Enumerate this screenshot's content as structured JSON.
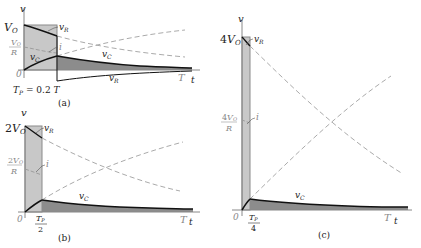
{
  "colors": {
    "axis": "#888888",
    "pulse_fill": "#c8c8c8",
    "pulse_stroke": "#8a8a8a",
    "vc_fill": "#8c8c8c",
    "curve": "#111111",
    "dashed": "#a0a0a0",
    "gray_text": "#888888"
  },
  "panels": [
    {
      "id": "a",
      "caption": "(a)",
      "y_axis_label": "v",
      "x_axis_label": "t",
      "origin_label": "0",
      "T_label": "T",
      "v_peak_label": "V",
      "v_peak_sub": "O",
      "v_peak_prefix": "",
      "current_label_num": "V",
      "current_label_num_sub": "O",
      "current_label_den": "R",
      "current_label_prefix": "",
      "pulse_width_label": "T_P = 0.2 T",
      "pulse_width_text_a": "T",
      "pulse_width_text_sub": "P",
      "pulse_width_text_b": " = 0.2 ",
      "pulse_width_text_c": "T",
      "curve_labels": {
        "vR_top": "v",
        "vR_top_sub": "R",
        "i": "i",
        "vC_left": "v",
        "vC_left_sub": "C",
        "vC_right": "v",
        "vC_right_sub": "C",
        "vR_bottom": "v",
        "vR_bottom_sub": "R"
      }
    },
    {
      "id": "b",
      "caption": "(b)",
      "y_axis_label": "v",
      "x_axis_label": "t",
      "origin_label": "0",
      "T_label": "T",
      "v_peak_prefix": "2",
      "v_peak_label": "V",
      "v_peak_sub": "O",
      "current_label_prefix": "2",
      "current_label_num": "V",
      "current_label_num_sub": "O",
      "current_label_den": "R",
      "pulse_width_num": "T",
      "pulse_width_num_sub": "P",
      "pulse_width_den": "2",
      "curve_labels": {
        "vR_top": "v",
        "vR_top_sub": "R",
        "i": "i",
        "vC": "v",
        "vC_sub": "C"
      }
    },
    {
      "id": "c",
      "caption": "(c)",
      "y_axis_label": "v",
      "x_axis_label": "t",
      "origin_label": "0",
      "T_label": "T",
      "v_peak_prefix": "4",
      "v_peak_label": "V",
      "v_peak_sub": "O",
      "current_label_prefix": "4",
      "current_label_num": "V",
      "current_label_num_sub": "O",
      "current_label_den": "R",
      "pulse_width_num": "T",
      "pulse_width_num_sub": "P",
      "pulse_width_den": "4",
      "curve_labels": {
        "vR_top": "v",
        "vR_top_sub": "R",
        "i": "i",
        "vC": "v",
        "vC_sub": "C"
      }
    }
  ]
}
